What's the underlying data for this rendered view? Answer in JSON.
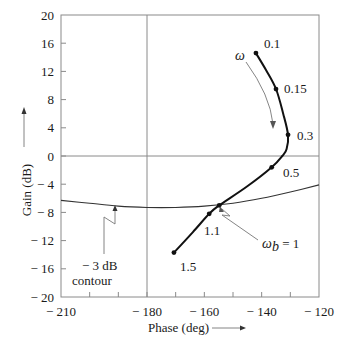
{
  "chart_data": {
    "type": "line",
    "title": "",
    "xlabel": "Phase (deg)",
    "ylabel": "Gain (dB)",
    "xlim": [
      -210,
      -120
    ],
    "ylim": [
      -20,
      20
    ],
    "grid": false,
    "reference_lines": {
      "x": -180,
      "y": 0
    },
    "x_ticks": [
      -210,
      -200,
      -190,
      -180,
      -170,
      -160,
      -150,
      -140,
      -130,
      -120
    ],
    "x_tick_labels": [
      "− 210",
      "− 180",
      "− 160",
      "− 140",
      "− 120"
    ],
    "x_tick_label_values": [
      -210,
      -180,
      -160,
      -140,
      -120
    ],
    "y_ticks": [
      20,
      16,
      12,
      8,
      4,
      0,
      -4,
      -8,
      -12,
      -16,
      -20
    ],
    "y_tick_labels": [
      "20",
      "16",
      "12",
      "8",
      "4",
      "0",
      "− 4",
      "− 8",
      "− 12",
      "− 16",
      "− 20"
    ],
    "series": [
      {
        "name": "Nichols frequency response",
        "x": [
          -142.0,
          -138.5,
          -135.0,
          -132.5,
          -130.8,
          -131.3,
          -132.8,
          -136.5,
          -145.0,
          -154.8,
          -158.3,
          -164.0,
          -170.6
        ],
        "y": [
          14.6,
          12.2,
          9.5,
          6.0,
          3.0,
          1.0,
          0.0,
          -1.6,
          -4.3,
          -7.0,
          -8.2,
          -10.8,
          -13.7
        ],
        "marked_points": [
          {
            "omega": "0.1",
            "x": -142.0,
            "y": 14.6
          },
          {
            "omega": "0.15",
            "x": -135.0,
            "y": 9.5
          },
          {
            "omega": "0.3",
            "x": -130.8,
            "y": 3.0
          },
          {
            "omega": "0.5",
            "x": -136.5,
            "y": -1.6
          },
          {
            "omega": "1",
            "x": -154.8,
            "y": -7.0
          },
          {
            "omega": "1.1",
            "x": -158.3,
            "y": -8.2
          },
          {
            "omega": "1.5",
            "x": -170.6,
            "y": -13.7
          }
        ]
      },
      {
        "name": "-3 dB contour",
        "x": [
          -210,
          -200,
          -190,
          -180,
          -170,
          -160,
          -150,
          -140,
          -130,
          -120
        ],
        "y": [
          -6.3,
          -6.7,
          -7.1,
          -7.3,
          -7.3,
          -7.1,
          -6.7,
          -6.0,
          -5.1,
          -4.1
        ]
      }
    ],
    "annotations": [
      {
        "text": "ω",
        "note": "arrow indicating increasing frequency direction along curve"
      },
      {
        "text": "ω_b = 1",
        "note": "bandwidth point where curve crosses -3 dB contour"
      },
      {
        "text": "− 3 dB contour",
        "note": "label for the closed-loop -3 dB M-contour"
      }
    ]
  },
  "labels": {
    "xlabel": "Phase (deg)",
    "ylabel": "Gain (dB)",
    "omega": "ω",
    "omega_b_main": "ω",
    "omega_b_sub": "b",
    "omega_b_rest": " = 1",
    "contour_line1": "− 3 dB",
    "contour_line2": "contour",
    "pt_01": "0.1",
    "pt_015": "0.15",
    "pt_03": "0.3",
    "pt_05": "0.5",
    "pt_11": "1.1",
    "pt_15": "1.5"
  },
  "colors": {
    "curve": "#111111",
    "frame": "#8a8a8a",
    "contour": "#333333",
    "background": "#ffffff"
  }
}
